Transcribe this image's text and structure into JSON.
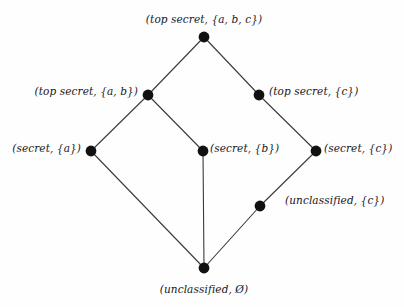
{
  "figure": {
    "kind": "hasse-diagram",
    "width": 404,
    "height": 307,
    "background_color": "#fefeff",
    "node_color": "#111111",
    "edge_color": "#3a3a3a",
    "node_radius": 5.4,
    "edge_width": 1.1
  },
  "nodes": [
    {
      "id": "ts-abc",
      "label": "(top secret, {a, b, c})",
      "x": 204,
      "y": 37,
      "label_x": 204,
      "label_y": 19,
      "anchor": "mid"
    },
    {
      "id": "ts-ab",
      "label": "(top secret, {a, b})",
      "x": 148,
      "y": 95,
      "label_x": 138,
      "label_y": 91,
      "anchor": "end"
    },
    {
      "id": "ts-c",
      "label": "(top secret, {c})",
      "x": 259,
      "y": 95,
      "label_x": 269,
      "label_y": 91,
      "anchor": "start"
    },
    {
      "id": "s-a",
      "label": "(secret, {a})",
      "x": 91,
      "y": 151,
      "label_x": 81,
      "label_y": 148,
      "anchor": "end"
    },
    {
      "id": "s-b",
      "label": "(secret, {b})",
      "x": 203,
      "y": 151,
      "label_x": 210,
      "label_y": 148,
      "anchor": "start"
    },
    {
      "id": "s-c",
      "label": "(secret, {c})",
      "x": 316,
      "y": 151,
      "label_x": 324,
      "label_y": 148,
      "anchor": "start"
    },
    {
      "id": "u-c",
      "label": "(unclassified, {c})",
      "x": 260,
      "y": 206,
      "label_x": 285,
      "label_y": 200,
      "anchor": "start"
    },
    {
      "id": "u-empty",
      "label": "(unclassified, Ø)",
      "x": 204,
      "y": 268,
      "label_x": 204,
      "label_y": 289,
      "anchor": "mid"
    }
  ],
  "edges": [
    {
      "id": "e1",
      "from": "ts-abc",
      "to": "ts-ab",
      "x1": 204,
      "y1": 37,
      "x2": 148,
      "y2": 95
    },
    {
      "id": "e2",
      "from": "ts-abc",
      "to": "ts-c",
      "x1": 204,
      "y1": 37,
      "x2": 259,
      "y2": 95
    },
    {
      "id": "e3",
      "from": "ts-ab",
      "to": "s-a",
      "x1": 148,
      "y1": 95,
      "x2": 91,
      "y2": 151
    },
    {
      "id": "e4",
      "from": "ts-ab",
      "to": "s-b",
      "x1": 148,
      "y1": 95,
      "x2": 203,
      "y2": 151
    },
    {
      "id": "e5",
      "from": "ts-c",
      "to": "s-c",
      "x1": 259,
      "y1": 95,
      "x2": 316,
      "y2": 151
    },
    {
      "id": "e6",
      "from": "s-a",
      "to": "u-empty",
      "x1": 91,
      "y1": 151,
      "x2": 204,
      "y2": 268
    },
    {
      "id": "e7",
      "from": "s-b",
      "to": "u-empty",
      "x1": 203,
      "y1": 151,
      "x2": 204,
      "y2": 268
    },
    {
      "id": "e8",
      "from": "s-c",
      "to": "u-c",
      "x1": 316,
      "y1": 151,
      "x2": 260,
      "y2": 206
    },
    {
      "id": "e9",
      "from": "u-c",
      "to": "u-empty",
      "x1": 260,
      "y1": 206,
      "x2": 204,
      "y2": 268
    }
  ]
}
